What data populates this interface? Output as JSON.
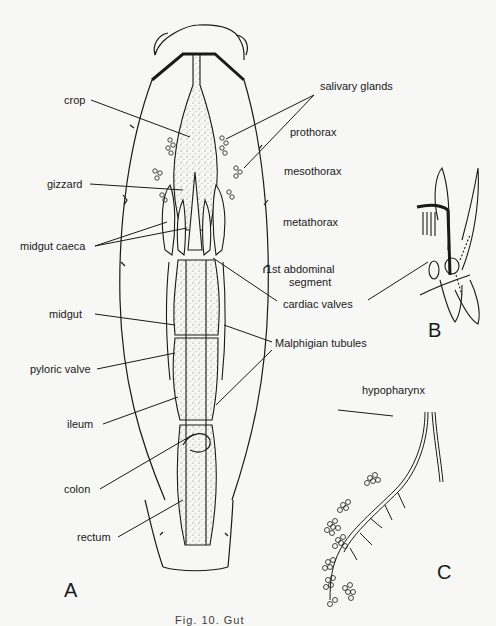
{
  "figure": {
    "panels": {
      "a": "A",
      "b": "B",
      "c": "C"
    },
    "caption": "Fig. 10. Gut",
    "labels": {
      "crop": "crop",
      "gizzard": "gizzard",
      "midgut_caeca": "midgut caeca",
      "midgut": "midgut",
      "pyloric_valve": "pyloric valve",
      "ileum": "ileum",
      "colon": "colon",
      "rectum": "rectum",
      "salivary_glands": "salivary glands",
      "prothorax": "prothorax",
      "mesothorax": "mesothorax",
      "metathorax": "metathorax",
      "first_abdominal_line1": "1st abdominal",
      "first_abdominal_line2": "segment",
      "cardiac_valves": "cardiac  valves",
      "malphigian_tubules": "Malphigian tubules",
      "hypopharynx": "hypopharynx"
    }
  }
}
